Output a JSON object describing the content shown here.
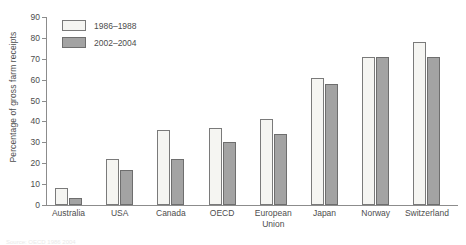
{
  "chart_data": {
    "type": "bar",
    "title": "",
    "subtitle": "",
    "xlabel": "",
    "ylabel": "Percentage of gross farm receipts",
    "ylim": [
      0,
      90
    ],
    "ytick_step": 10,
    "yticks": [
      "0",
      "10",
      "20",
      "30",
      "40",
      "50",
      "60",
      "70",
      "80",
      "90"
    ],
    "grid": false,
    "legend_position": "top-left",
    "categories": [
      "Australia",
      "USA",
      "Canada",
      "OECD",
      "European\nUnion",
      "Japan",
      "Norway",
      "Switzerland"
    ],
    "series": [
      {
        "name": "1986–1988",
        "color": "#f5f5f2",
        "values": [
          8,
          22,
          36,
          37,
          41,
          61,
          71,
          78
        ]
      },
      {
        "name": "2002–2004",
        "color": "#a3a3a3",
        "values": [
          3.5,
          17,
          22,
          30,
          34,
          58,
          71,
          71
        ]
      }
    ]
  },
  "footnote": "Source: OECD 1986 2004"
}
